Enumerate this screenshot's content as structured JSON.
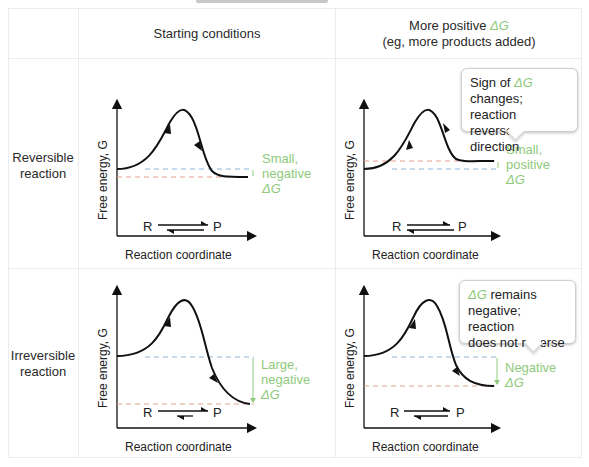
{
  "header": {
    "col1": "Starting conditions",
    "col2_line1": "More positive ",
    "col2_dg": "ΔG",
    "col2_line2": "(eg, more products added)"
  },
  "rows": [
    {
      "label_line1": "Reversible",
      "label_line2": "reaction"
    },
    {
      "label_line1": "Irreversible",
      "label_line2": "reaction"
    }
  ],
  "axes": {
    "y_label": "Free energy, G",
    "x_label": "Reaction coordinate"
  },
  "species": {
    "reactant": "R",
    "product": "P"
  },
  "panels": {
    "rev_start": {
      "dg_line1": "Small,",
      "dg_line2": "negative",
      "dg_line3": "ΔG"
    },
    "rev_shift": {
      "dg_line1": "Small,",
      "dg_line2": "positive",
      "dg_line3": "ΔG",
      "callout_pre": "Sign of ",
      "callout_dg": "ΔG",
      "callout_line2": "changes; reaction",
      "callout_line3": "reverses direction"
    },
    "irr_start": {
      "dg_line1": "Large,",
      "dg_line2": "negative",
      "dg_line3": "ΔG"
    },
    "irr_shift": {
      "dg_line1": "Negative",
      "dg_line2": "ΔG",
      "callout_dg": "ΔG",
      "callout_post": " remains",
      "callout_line2": "negative; reaction",
      "callout_line3": "does not reverse"
    }
  },
  "colors": {
    "green": "#8fca7c",
    "blue_dash": "#8fb4d6",
    "red_dash": "#e0a090",
    "curve": "#111111"
  }
}
